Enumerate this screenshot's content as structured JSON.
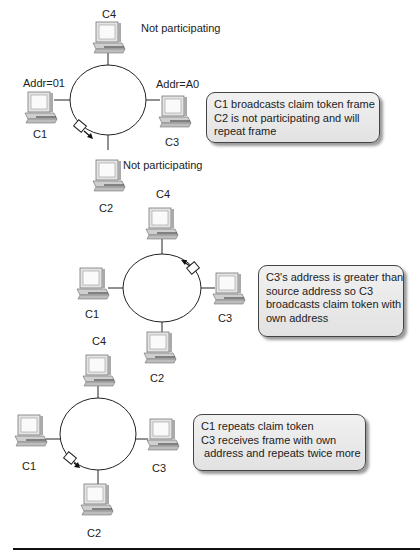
{
  "panels": [
    {
      "labels": {
        "c4": "C4",
        "c4_status": "Not participating",
        "c1_addr": "Addr=01",
        "c1": "C1",
        "c3_addr": "Addr=A0",
        "c3": "C3",
        "c2": "C2",
        "c2_status": "Not participating"
      },
      "note": [
        "C1 broadcasts claim token frame",
        "C2 is not participating and will",
        "repeat frame"
      ]
    },
    {
      "labels": {
        "c4": "C4",
        "c1": "C1",
        "c3": "C3",
        "c2": "C2"
      },
      "note": [
        "C3's address is greater than",
        "source address so C3",
        "broadcasts claim token with",
        "own address"
      ]
    },
    {
      "labels": {
        "c4": "C4",
        "c1": "C1",
        "c3": "C3",
        "c2": "C2"
      },
      "note": [
        "C1 repeats claim token",
        "C3 receives frame with own",
        " address and repeats twice more"
      ]
    }
  ],
  "colors": {
    "line": "#222222",
    "note_bg": "#e8e8e8",
    "computer": "#cfcfcf"
  }
}
